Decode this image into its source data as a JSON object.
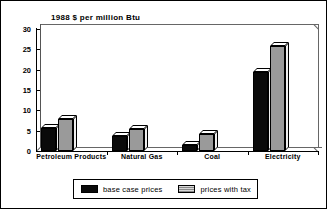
{
  "chart_data": {
    "type": "bar",
    "title": "1988 $ per million Btu",
    "xlabel": "",
    "ylabel": "",
    "ylim": [
      0,
      30
    ],
    "yticks": [
      0,
      5,
      10,
      15,
      20,
      25,
      30
    ],
    "ytick_labels": [
      "0",
      "5",
      "10",
      "15",
      "20",
      "25",
      "30"
    ],
    "grid": false,
    "legend_position": "bottom",
    "categories": [
      "Petroleum Products",
      "Natural Gas",
      "Coal",
      "Electricity"
    ],
    "series": [
      {
        "name": "base case prices",
        "color": "#0a0a0a",
        "values": [
          5.6,
          3.8,
          1.5,
          19.5
        ]
      },
      {
        "name": "prices with tax",
        "color": "#9a9a9a",
        "values": [
          7.8,
          5.3,
          4.2,
          25.7
        ]
      }
    ]
  },
  "legend": {
    "items": [
      {
        "label": "base case prices",
        "swatch": "black"
      },
      {
        "label": "prices with tax",
        "swatch": "gray"
      }
    ]
  }
}
